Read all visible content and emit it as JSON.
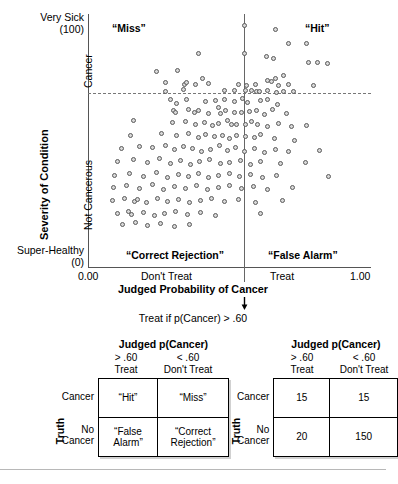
{
  "figure": {
    "scatter": {
      "y_axis": {
        "title": "Severity of Condition",
        "top_label": "Very Sick",
        "top_value": "(100)",
        "bottom_label": "Super-Healthy",
        "bottom_value": "(0)",
        "upper_region": "Cancer",
        "lower_region": "Not Cancerous"
      },
      "x_axis": {
        "title": "Judged Probability of Cancer",
        "ticks": [
          "0.00",
          "Don't Treat",
          "Treat",
          "1.00"
        ]
      },
      "quadrants": {
        "top_left": "“Miss”",
        "top_right": "“Hit”",
        "bottom_left": "“Correct Rejection”",
        "bottom_right": "“False Alarm”"
      },
      "rule_text": "Treat if p(Cancer) > .60",
      "arrow": "down-arrow"
    },
    "tables": {
      "left": {
        "title": "Judged p(Cancer)",
        "col_headers": [
          {
            "line1": "> .60",
            "line2": "Treat"
          },
          {
            "line1": "< .60",
            "line2": "Don't Treat"
          }
        ],
        "row_axis_label": "Truth",
        "row_headers": [
          {
            "line1": "Cancer",
            "line2": ""
          },
          {
            "line1": "No",
            "line2": "Cancer"
          }
        ],
        "cells": [
          [
            "“Hit”",
            "“Miss”"
          ],
          [
            "“False Alarm”",
            "“Correct Rejection”"
          ]
        ]
      },
      "right": {
        "title": "Judged p(Cancer)",
        "col_headers": [
          {
            "line1": "> .60",
            "line2": "Treat"
          },
          {
            "line1": "< .60",
            "line2": "Don't Treat"
          }
        ],
        "row_axis_label": "Truth",
        "row_headers": [
          {
            "line1": "Cancer",
            "line2": ""
          },
          {
            "line1": "No",
            "line2": "Cancer"
          }
        ],
        "cells": [
          [
            "15",
            "15"
          ],
          [
            "20",
            "150"
          ]
        ]
      }
    }
  },
  "chart_data": {
    "type": "scatter",
    "title": "",
    "xlabel": "Judged Probability of Cancer",
    "ylabel": "Severity of Condition",
    "xlim": [
      0.0,
      1.0
    ],
    "ylim": [
      0,
      100
    ],
    "xtick_positions": [
      0.0,
      0.27,
      0.72,
      1.0
    ],
    "xtick_labels": [
      "0.00",
      "Don't Treat",
      "Treat",
      "1.00"
    ],
    "ytick_labels": [
      "Super-Healthy (0)",
      "Very Sick (100)"
    ],
    "grid": false,
    "legend": null,
    "annotations": [
      {
        "text": "“Miss”",
        "x": 0.09,
        "y": 94
      },
      {
        "text": "“Hit”",
        "x": 0.78,
        "y": 94
      },
      {
        "text": "“Correct Rejection”",
        "x": 0.16,
        "y": 5
      },
      {
        "text": "“False Alarm”",
        "x": 0.68,
        "y": 5
      },
      {
        "text": "Treat if p(Cancer) > .60",
        "x": 0.5,
        "y": -22
      }
    ],
    "reference_lines": [
      {
        "orientation": "vertical",
        "value": 0.6,
        "style": "solid",
        "label": "treatment threshold"
      },
      {
        "orientation": "horizontal",
        "value": 69,
        "style": "dashed",
        "label": "cancer / not cancerous boundary"
      }
    ],
    "points": [
      [
        0.555,
        95.3
      ],
      [
        0.668,
        93.5
      ],
      [
        0.714,
        88.1
      ],
      [
        0.778,
        88.1
      ],
      [
        0.394,
        84.2
      ],
      [
        0.556,
        84.2
      ],
      [
        0.635,
        83.0
      ],
      [
        0.66,
        82.2
      ],
      [
        0.784,
        80.6
      ],
      [
        0.817,
        80.6
      ],
      [
        0.852,
        80.2
      ],
      [
        0.246,
        77.1
      ],
      [
        0.319,
        77.5
      ],
      [
        0.407,
        74.3
      ],
      [
        0.695,
        75.5
      ],
      [
        0.277,
        72.7
      ],
      [
        0.344,
        72.0
      ],
      [
        0.352,
        72.7
      ],
      [
        0.383,
        72.0
      ],
      [
        0.43,
        72.3
      ],
      [
        0.535,
        72.0
      ],
      [
        0.563,
        71.5
      ],
      [
        0.596,
        72.0
      ],
      [
        0.64,
        73.5
      ],
      [
        0.651,
        73.1
      ],
      [
        0.666,
        74.3
      ],
      [
        0.678,
        71.5
      ],
      [
        0.712,
        71.9
      ],
      [
        0.8,
        71.5
      ],
      [
        0.277,
        69.2
      ],
      [
        0.341,
        69.9
      ],
      [
        0.486,
        69.4
      ],
      [
        0.52,
        69.6
      ],
      [
        0.562,
        69.4
      ],
      [
        0.581,
        69.4
      ],
      [
        0.6,
        69.2
      ],
      [
        0.611,
        69.0
      ],
      [
        0.64,
        69.6
      ],
      [
        0.67,
        68.6
      ],
      [
        0.695,
        69.1
      ],
      [
        0.731,
        69.2
      ],
      [
        0.294,
        65.9
      ],
      [
        0.317,
        64.4
      ],
      [
        0.352,
        66.0
      ],
      [
        0.419,
        65.3
      ],
      [
        0.455,
        65.6
      ],
      [
        0.487,
        66.0
      ],
      [
        0.52,
        65.2
      ],
      [
        0.549,
        66.3
      ],
      [
        0.569,
        65.0
      ],
      [
        0.614,
        65.6
      ],
      [
        0.639,
        66.1
      ],
      [
        0.673,
        64.1
      ],
      [
        0.305,
        61.8
      ],
      [
        0.312,
        61.0
      ],
      [
        0.358,
        62.1
      ],
      [
        0.378,
        61.0
      ],
      [
        0.395,
        61.8
      ],
      [
        0.429,
        60.4
      ],
      [
        0.466,
        62.8
      ],
      [
        0.47,
        60.4
      ],
      [
        0.488,
        61.8
      ],
      [
        0.52,
        61.0
      ],
      [
        0.545,
        61.0
      ],
      [
        0.573,
        61.4
      ],
      [
        0.601,
        61.8
      ],
      [
        0.628,
        60.1
      ],
      [
        0.657,
        62.1
      ],
      [
        0.704,
        60.4
      ],
      [
        0.163,
        57.8
      ],
      [
        0.301,
        57.0
      ],
      [
        0.349,
        57.4
      ],
      [
        0.384,
        56.3
      ],
      [
        0.415,
        57.0
      ],
      [
        0.443,
        55.8
      ],
      [
        0.466,
        56.6
      ],
      [
        0.497,
        57.8
      ],
      [
        0.509,
        56.0
      ],
      [
        0.53,
        56.0
      ],
      [
        0.562,
        56.3
      ],
      [
        0.583,
        57.4
      ],
      [
        0.604,
        56.0
      ],
      [
        0.64,
        55.2
      ],
      [
        0.676,
        56.6
      ],
      [
        0.722,
        55.2
      ],
      [
        0.776,
        55.6
      ],
      [
        0.151,
        51.9
      ],
      [
        0.264,
        52.7
      ],
      [
        0.316,
        51.6
      ],
      [
        0.359,
        52.7
      ],
      [
        0.392,
        50.8
      ],
      [
        0.42,
        52.3
      ],
      [
        0.451,
        51.2
      ],
      [
        0.478,
        51.6
      ],
      [
        0.505,
        50.4
      ],
      [
        0.53,
        51.9
      ],
      [
        0.559,
        51.2
      ],
      [
        0.592,
        50.8
      ],
      [
        0.615,
        52.3
      ],
      [
        0.663,
        50.4
      ],
      [
        0.735,
        50.0
      ],
      [
        0.119,
        46.5
      ],
      [
        0.185,
        47.3
      ],
      [
        0.231,
        46.9
      ],
      [
        0.275,
        47.7
      ],
      [
        0.308,
        46.1
      ],
      [
        0.339,
        47.3
      ],
      [
        0.371,
        46.5
      ],
      [
        0.404,
        45.4
      ],
      [
        0.437,
        46.1
      ],
      [
        0.469,
        47.7
      ],
      [
        0.497,
        45.8
      ],
      [
        0.525,
        46.9
      ],
      [
        0.556,
        45.4
      ],
      [
        0.592,
        46.5
      ],
      [
        0.628,
        45.0
      ],
      [
        0.668,
        46.1
      ],
      [
        0.714,
        45.4
      ],
      [
        0.823,
        45.8
      ],
      [
        0.106,
        41.5
      ],
      [
        0.163,
        42.3
      ],
      [
        0.212,
        41.1
      ],
      [
        0.257,
        42.7
      ],
      [
        0.294,
        40.7
      ],
      [
        0.33,
        41.9
      ],
      [
        0.366,
        40.3
      ],
      [
        0.398,
        41.5
      ],
      [
        0.434,
        42.3
      ],
      [
        0.47,
        40.7
      ],
      [
        0.505,
        41.1
      ],
      [
        0.541,
        42.0
      ],
      [
        0.577,
        40.3
      ],
      [
        0.613,
        41.5
      ],
      [
        0.684,
        40.7
      ],
      [
        0.772,
        41.1
      ],
      [
        0.096,
        36.0
      ],
      [
        0.15,
        36.8
      ],
      [
        0.197,
        35.6
      ],
      [
        0.243,
        37.2
      ],
      [
        0.283,
        35.2
      ],
      [
        0.322,
        36.4
      ],
      [
        0.358,
        35.6
      ],
      [
        0.394,
        36.8
      ],
      [
        0.43,
        35.2
      ],
      [
        0.466,
        36.0
      ],
      [
        0.502,
        36.8
      ],
      [
        0.538,
        35.6
      ],
      [
        0.578,
        36.4
      ],
      [
        0.622,
        35.2
      ],
      [
        0.67,
        36.0
      ],
      [
        0.856,
        35.6
      ],
      [
        0.093,
        31.1
      ],
      [
        0.14,
        31.9
      ],
      [
        0.186,
        30.7
      ],
      [
        0.232,
        32.3
      ],
      [
        0.27,
        30.3
      ],
      [
        0.31,
        31.5
      ],
      [
        0.348,
        30.7
      ],
      [
        0.386,
        31.9
      ],
      [
        0.425,
        30.3
      ],
      [
        0.463,
        31.1
      ],
      [
        0.502,
        31.9
      ],
      [
        0.545,
        30.7
      ],
      [
        0.589,
        31.5
      ],
      [
        0.639,
        30.3
      ],
      [
        0.727,
        31.1
      ],
      [
        0.089,
        25.9
      ],
      [
        0.131,
        26.7
      ],
      [
        0.168,
        25.5
      ],
      [
        0.176,
        26.3
      ],
      [
        0.209,
        25.1
      ],
      [
        0.248,
        26.7
      ],
      [
        0.285,
        25.5
      ],
      [
        0.323,
        26.3
      ],
      [
        0.361,
        25.1
      ],
      [
        0.401,
        25.9
      ],
      [
        0.441,
        26.7
      ],
      [
        0.487,
        25.5
      ],
      [
        0.536,
        26.3
      ],
      [
        0.596,
        25.1
      ],
      [
        0.692,
        25.9
      ],
      [
        0.108,
        21.0
      ],
      [
        0.145,
        21.8
      ],
      [
        0.157,
        20.6
      ],
      [
        0.197,
        21.4
      ],
      [
        0.236,
        20.2
      ],
      [
        0.274,
        21.0
      ],
      [
        0.312,
        21.8
      ],
      [
        0.355,
        20.6
      ],
      [
        0.402,
        21.4
      ],
      [
        0.455,
        20.2
      ],
      [
        0.614,
        21.0
      ],
      [
        0.125,
        16.5
      ],
      [
        0.17,
        17.3
      ],
      [
        0.214,
        16.1
      ],
      [
        0.259,
        16.9
      ],
      [
        0.308,
        15.7
      ],
      [
        0.36,
        16.5
      ]
    ]
  },
  "caption": {
    "text": ""
  }
}
